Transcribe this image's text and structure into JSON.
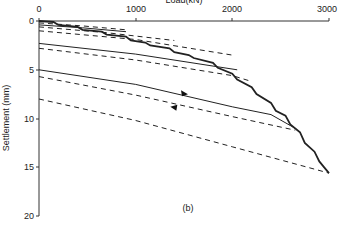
{
  "chart_data": {
    "type": "line",
    "title": "Load(kN)",
    "xlabel": "Load(kN)",
    "ylabel": "Settlement (mm)",
    "panel_label": "(b)",
    "xlim": [
      0,
      3000
    ],
    "ylim": [
      0,
      20
    ],
    "y_inverted": true,
    "x_axis_position": "top",
    "grid": false,
    "legend": null,
    "x_ticks": [
      0,
      1000,
      2000,
      3000
    ],
    "y_ticks": [
      0,
      5,
      10,
      15,
      20
    ],
    "series": [
      {
        "name": "loading envelope (stepped)",
        "style": "solid-thick",
        "points": [
          [
            0,
            0
          ],
          [
            150,
            0.1
          ],
          [
            200,
            0.4
          ],
          [
            400,
            0.6
          ],
          [
            450,
            0.9
          ],
          [
            650,
            1.1
          ],
          [
            700,
            1.4
          ],
          [
            900,
            1.6
          ],
          [
            950,
            2.0
          ],
          [
            1100,
            2.2
          ],
          [
            1150,
            2.5
          ],
          [
            1350,
            2.8
          ],
          [
            1400,
            3.2
          ],
          [
            1550,
            3.5
          ],
          [
            1600,
            3.8
          ],
          [
            1800,
            4.3
          ],
          [
            1850,
            4.8
          ],
          [
            2000,
            5.4
          ],
          [
            2050,
            6.0
          ],
          [
            2200,
            6.8
          ],
          [
            2250,
            7.5
          ],
          [
            2400,
            8.4
          ],
          [
            2450,
            9.2
          ],
          [
            2550,
            9.7
          ],
          [
            2600,
            10.6
          ],
          [
            2700,
            11.4
          ],
          [
            2750,
            12.5
          ],
          [
            2850,
            13.4
          ],
          [
            2900,
            14.4
          ],
          [
            2950,
            15.0
          ],
          [
            3000,
            15.6
          ]
        ]
      },
      {
        "name": "unloading 1",
        "style": "dashed",
        "points": [
          [
            0,
            0.2
          ],
          [
            450,
            0.5
          ],
          [
            900,
            0.9
          ]
        ]
      },
      {
        "name": "reloading 1",
        "style": "solid",
        "points": [
          [
            0,
            0.4
          ],
          [
            450,
            0.7
          ],
          [
            900,
            1.1
          ]
        ]
      },
      {
        "name": "unloading 2",
        "style": "dashed",
        "points": [
          [
            0,
            0.6
          ],
          [
            700,
            1.2
          ],
          [
            1400,
            2.0
          ]
        ]
      },
      {
        "name": "unloading 3",
        "style": "dashed",
        "points": [
          [
            0,
            1.0
          ],
          [
            1000,
            1.9
          ],
          [
            2000,
            3.5
          ]
        ]
      },
      {
        "name": "reloading 3",
        "style": "solid",
        "points": [
          [
            0,
            2.3
          ],
          [
            1000,
            3.4
          ],
          [
            2050,
            5.0
          ]
        ]
      },
      {
        "name": "unloading 4",
        "style": "dashed",
        "points": [
          [
            0,
            2.8
          ],
          [
            1000,
            4.0
          ],
          [
            2000,
            5.6
          ],
          [
            2200,
            6.2
          ]
        ]
      },
      {
        "name": "reloading 4",
        "style": "solid",
        "points": [
          [
            0,
            5.0
          ],
          [
            1000,
            6.5
          ],
          [
            2000,
            8.8
          ],
          [
            2400,
            9.6
          ],
          [
            2650,
            11.0
          ]
        ]
      },
      {
        "name": "unloading 5",
        "style": "dashed",
        "points": [
          [
            0,
            5.7
          ],
          [
            1000,
            7.6
          ],
          [
            2000,
            9.8
          ],
          [
            2650,
            11.2
          ]
        ]
      },
      {
        "name": "unloading final",
        "style": "dashed",
        "points": [
          [
            0,
            8.0
          ],
          [
            1000,
            10.2
          ],
          [
            2000,
            12.9
          ],
          [
            3000,
            15.6
          ]
        ]
      }
    ],
    "annotations": [
      {
        "type": "arrow",
        "direction": "right",
        "at": [
          1500,
          7.4
        ],
        "series": "reloading 4"
      },
      {
        "type": "arrow",
        "direction": "left",
        "at": [
          1400,
          8.9
        ],
        "series": "unloading 5"
      }
    ]
  }
}
